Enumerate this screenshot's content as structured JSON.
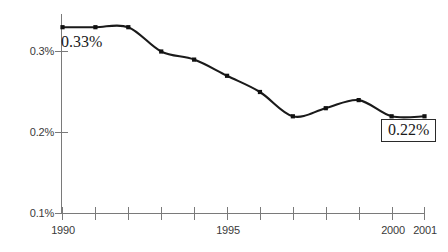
{
  "chart_data": {
    "type": "line",
    "title": "",
    "subtitle": "",
    "xlabel": "",
    "ylabel": "",
    "categories": [
      "1990",
      "1991",
      "1992",
      "1993",
      "1994",
      "1995",
      "1996",
      "1997",
      "1998",
      "1999",
      "2000",
      "2001"
    ],
    "x": [
      1990,
      1991,
      1992,
      1993,
      1994,
      1995,
      1996,
      1997,
      1998,
      1999,
      2000,
      2001
    ],
    "values": [
      0.33,
      0.33,
      0.33,
      0.3,
      0.29,
      0.27,
      0.25,
      0.22,
      0.23,
      0.24,
      0.22,
      0.22
    ],
    "series": [
      {
        "name": "",
        "values": [
          0.33,
          0.33,
          0.33,
          0.3,
          0.29,
          0.27,
          0.25,
          0.22,
          0.23,
          0.24,
          0.22,
          0.22
        ],
        "color": "#1a1a1a",
        "marker": "square"
      }
    ],
    "ylim": [
      0.1,
      0.35
    ],
    "xlim": [
      1990,
      2001
    ],
    "y_ticks": [
      0.1,
      0.2,
      0.3
    ],
    "y_tick_labels": [
      "0.1%",
      "0.2%",
      "0.3%"
    ],
    "x_ticks": [
      1990,
      1991,
      1992,
      1993,
      1994,
      1995,
      1996,
      1997,
      1998,
      1999,
      2000,
      2001
    ],
    "x_tick_labels": [
      "1990",
      "",
      "",
      "",
      "",
      "1995",
      "",
      "",
      "",
      "",
      "2000",
      "2001"
    ],
    "x_tick_labels_visible": [
      "1990",
      "1995",
      "2000",
      "2001"
    ],
    "grid": false,
    "legend": false,
    "legend_position": "none",
    "annotations": [
      {
        "text": "0.33%",
        "x": 1990,
        "y": 0.33,
        "style": "plain"
      },
      {
        "text": "0.22%",
        "x": 2001,
        "y": 0.22,
        "style": "boxed"
      }
    ]
  },
  "axis": {
    "y_labels": [
      {
        "text": "0.3%"
      },
      {
        "text": "0.2%"
      },
      {
        "text": "0.1%"
      }
    ],
    "x_labels": [
      {
        "text": "1990"
      },
      {
        "text": "1995"
      },
      {
        "text": "2000"
      },
      {
        "text": "2001"
      }
    ]
  },
  "annotations": {
    "start_value": "0.33%",
    "end_value": "0.22%"
  },
  "colors": {
    "line": "#1a1a1a",
    "marker": "#111111",
    "axis": "#6e6e6e",
    "tick_text": "#3a3a3a",
    "annotation_text": "#1a1a1a",
    "annotation_box_border": "#2a2a2a",
    "background": "#ffffff"
  }
}
